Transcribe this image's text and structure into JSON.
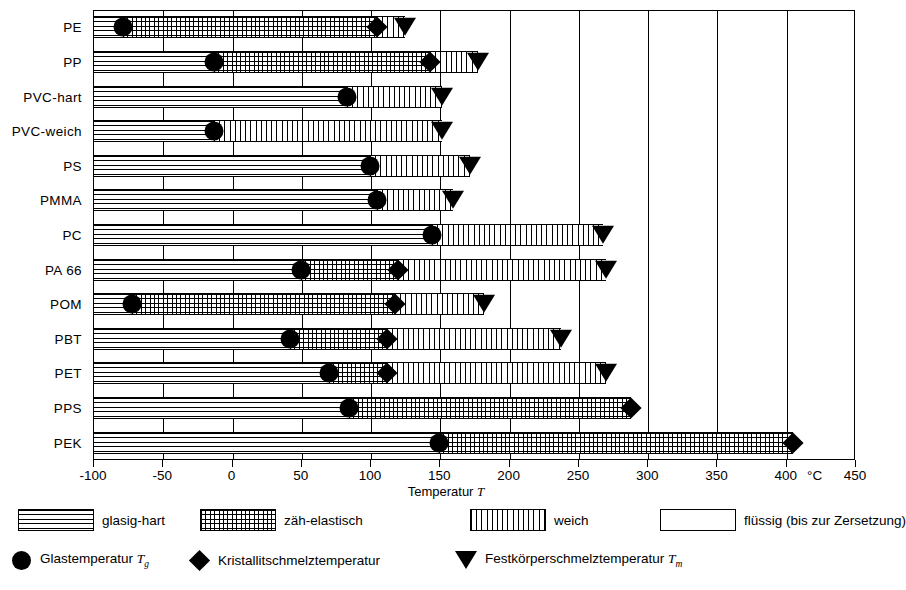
{
  "chart_data": {
    "type": "bar",
    "title": "",
    "xlabel": "Temperatur T",
    "ylabel": "",
    "unit": "°C",
    "xlim": [
      -100,
      450
    ],
    "xticks": [
      -100,
      -50,
      0,
      50,
      100,
      150,
      200,
      250,
      300,
      350,
      400,
      450
    ],
    "xticklabels": [
      "-100",
      "-50",
      "0",
      "50",
      "100",
      "150",
      "200",
      "250",
      "300",
      "350",
      "400",
      "450"
    ],
    "grid": true,
    "legend_position": "below",
    "categories": [
      "PE",
      "PP",
      "PVC-hart",
      "PVC-weich",
      "PS",
      "PMMA",
      "PC",
      "PA 66",
      "POM",
      "PBT",
      "PET",
      "PPS",
      "PEK"
    ],
    "state_names": [
      "glasig-hart",
      "zäh-elastisch",
      "weich",
      "flüssig (bis zur Zersetzung)"
    ],
    "marker_names": [
      "Glastemperatur Tg",
      "Kristallitschmelztemperatur",
      "Festkörperschmelztemperatur Tm"
    ],
    "rows": [
      {
        "label": "PE",
        "segments": [
          {
            "state": "glasig-hart",
            "from": -100,
            "to": -78
          },
          {
            "state": "zäh-elastisch",
            "from": -78,
            "to": 105
          },
          {
            "state": "weich",
            "from": 105,
            "to": 125
          },
          {
            "state": "flüssig (bis zur Zersetzung)",
            "from": 125,
            "to": 450
          }
        ],
        "markers": [
          {
            "type": "Glastemperatur",
            "value": -78
          },
          {
            "type": "Kristallitschmelztemperatur",
            "value": 105
          },
          {
            "type": "Festkörperschmelztemperatur",
            "value": 125
          }
        ]
      },
      {
        "label": "PP",
        "segments": [
          {
            "state": "glasig-hart",
            "from": -100,
            "to": -13
          },
          {
            "state": "zäh-elastisch",
            "from": -13,
            "to": 143
          },
          {
            "state": "weich",
            "from": 143,
            "to": 178
          },
          {
            "state": "flüssig (bis zur Zersetzung)",
            "from": 178,
            "to": 450
          }
        ],
        "markers": [
          {
            "type": "Glastemperatur",
            "value": -13
          },
          {
            "type": "Kristallitschmelztemperatur",
            "value": 143
          },
          {
            "type": "Festkörperschmelztemperatur",
            "value": 178
          }
        ]
      },
      {
        "label": "PVC-hart",
        "segments": [
          {
            "state": "glasig-hart",
            "from": -100,
            "to": 83
          },
          {
            "state": "weich",
            "from": 83,
            "to": 152
          },
          {
            "state": "flüssig (bis zur Zersetzung)",
            "from": 152,
            "to": 450
          }
        ],
        "markers": [
          {
            "type": "Glastemperatur",
            "value": 83
          },
          {
            "type": "Festkörperschmelztemperatur",
            "value": 152
          }
        ]
      },
      {
        "label": "PVC-weich",
        "segments": [
          {
            "state": "glasig-hart",
            "from": -100,
            "to": -13
          },
          {
            "state": "weich",
            "from": -13,
            "to": 152
          },
          {
            "state": "flüssig (bis zur Zersetzung)",
            "from": 152,
            "to": 450
          }
        ],
        "markers": [
          {
            "type": "Glastemperatur",
            "value": -13
          },
          {
            "type": "Festkörperschmelztemperatur",
            "value": 152
          }
        ]
      },
      {
        "label": "PS",
        "segments": [
          {
            "state": "glasig-hart",
            "from": -100,
            "to": 100
          },
          {
            "state": "weich",
            "from": 100,
            "to": 172
          },
          {
            "state": "flüssig (bis zur Zersetzung)",
            "from": 172,
            "to": 450
          }
        ],
        "markers": [
          {
            "type": "Glastemperatur",
            "value": 100
          },
          {
            "type": "Festkörperschmelztemperatur",
            "value": 172
          }
        ]
      },
      {
        "label": "PMMA",
        "segments": [
          {
            "state": "glasig-hart",
            "from": -100,
            "to": 105
          },
          {
            "state": "weich",
            "from": 105,
            "to": 160
          },
          {
            "state": "flüssig (bis zur Zersetzung)",
            "from": 160,
            "to": 450
          }
        ],
        "markers": [
          {
            "type": "Glastemperatur",
            "value": 105
          },
          {
            "type": "Festkörperschmelztemperatur",
            "value": 160
          }
        ]
      },
      {
        "label": "PC",
        "segments": [
          {
            "state": "glasig-hart",
            "from": -100,
            "to": 145
          },
          {
            "state": "weich",
            "from": 145,
            "to": 268
          },
          {
            "state": "flüssig (bis zur Zersetzung)",
            "from": 268,
            "to": 450
          }
        ],
        "markers": [
          {
            "type": "Glastemperatur",
            "value": 145
          },
          {
            "type": "Festkörperschmelztemperatur",
            "value": 268
          }
        ]
      },
      {
        "label": "PA 66",
        "segments": [
          {
            "state": "glasig-hart",
            "from": -100,
            "to": 50
          },
          {
            "state": "zäh-elastisch",
            "from": 50,
            "to": 120
          },
          {
            "state": "weich",
            "from": 120,
            "to": 270
          },
          {
            "state": "flüssig (bis zur Zersetzung)",
            "from": 270,
            "to": 450
          }
        ],
        "markers": [
          {
            "type": "Glastemperatur",
            "value": 50
          },
          {
            "type": "Kristallitschmelztemperatur",
            "value": 120
          },
          {
            "type": "Festkörperschmelztemperatur",
            "value": 270
          }
        ]
      },
      {
        "label": "POM",
        "segments": [
          {
            "state": "glasig-hart",
            "from": -100,
            "to": -72
          },
          {
            "state": "zäh-elastisch",
            "from": -72,
            "to": 118
          },
          {
            "state": "weich",
            "from": 118,
            "to": 182
          },
          {
            "state": "flüssig (bis zur Zersetzung)",
            "from": 182,
            "to": 450
          }
        ],
        "markers": [
          {
            "type": "Glastemperatur",
            "value": -72
          },
          {
            "type": "Kristallitschmelztemperatur",
            "value": 118
          },
          {
            "type": "Festkörperschmelztemperatur",
            "value": 182
          }
        ]
      },
      {
        "label": "PBT",
        "segments": [
          {
            "state": "glasig-hart",
            "from": -100,
            "to": 42
          },
          {
            "state": "zäh-elastisch",
            "from": 42,
            "to": 112
          },
          {
            "state": "weich",
            "from": 112,
            "to": 238
          },
          {
            "state": "flüssig (bis zur Zersetzung)",
            "from": 238,
            "to": 450
          }
        ],
        "markers": [
          {
            "type": "Glastemperatur",
            "value": 42
          },
          {
            "type": "Kristallitschmelztemperatur",
            "value": 112
          },
          {
            "type": "Festkörperschmelztemperatur",
            "value": 238
          }
        ]
      },
      {
        "label": "PET",
        "segments": [
          {
            "state": "glasig-hart",
            "from": -100,
            "to": 70
          },
          {
            "state": "zäh-elastisch",
            "from": 70,
            "to": 112
          },
          {
            "state": "weich",
            "from": 112,
            "to": 270
          },
          {
            "state": "flüssig (bis zur Zersetzung)",
            "from": 270,
            "to": 450
          }
        ],
        "markers": [
          {
            "type": "Glastemperatur",
            "value": 70
          },
          {
            "type": "Kristallitschmelztemperatur",
            "value": 112
          },
          {
            "type": "Festkörperschmelztemperatur",
            "value": 270
          }
        ]
      },
      {
        "label": "PPS",
        "segments": [
          {
            "state": "glasig-hart",
            "from": -100,
            "to": 85
          },
          {
            "state": "zäh-elastisch",
            "from": 85,
            "to": 288
          },
          {
            "state": "flüssig (bis zur Zersetzung)",
            "from": 288,
            "to": 450
          }
        ],
        "markers": [
          {
            "type": "Glastemperatur",
            "value": 85
          },
          {
            "type": "Kristallitschmelztemperatur",
            "value": 288
          }
        ]
      },
      {
        "label": "PEK",
        "segments": [
          {
            "state": "glasig-hart",
            "from": -100,
            "to": 150
          },
          {
            "state": "zäh-elastisch",
            "from": 150,
            "to": 405
          },
          {
            "state": "flüssig (bis zur Zersetzung)",
            "from": 405,
            "to": 450
          }
        ],
        "markers": [
          {
            "type": "Glastemperatur",
            "value": 150
          },
          {
            "type": "Kristallitschmelztemperatur",
            "value": 405
          }
        ]
      }
    ]
  },
  "axis": {
    "title_prefix": "Temperatur ",
    "title_symbol": "T",
    "unit": "°C"
  },
  "legend": {
    "patterns": [
      {
        "key": "glasig",
        "label": "glasig-hart"
      },
      {
        "key": "zaeh",
        "label": "zäh-elastisch"
      },
      {
        "key": "weich",
        "label": "weich"
      },
      {
        "key": "fluessig",
        "label": "flüssig (bis zur Zersetzung)"
      }
    ],
    "markers": [
      {
        "key": "circle",
        "label": "Glastemperatur ",
        "symbol": "T",
        "sub": "g"
      },
      {
        "key": "diamond",
        "label": "Kristallitschmelztemperatur",
        "symbol": "",
        "sub": ""
      },
      {
        "key": "triangle",
        "label": "Festkörperschmelztemperatur ",
        "symbol": "T",
        "sub": "m"
      }
    ]
  },
  "colors": {
    "ink": "#000000",
    "paper": "#ffffff"
  }
}
